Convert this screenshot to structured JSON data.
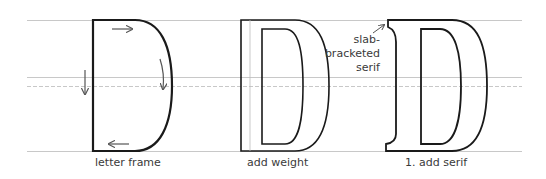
{
  "diagram": {
    "guidelines": [
      "cap-line",
      "mid-line",
      "dashed-mid-line",
      "baseline"
    ],
    "stages": [
      {
        "label": "letter frame"
      },
      {
        "label": "add weight"
      },
      {
        "label": "1. add serif"
      }
    ],
    "annotation": {
      "line1": "slab-",
      "line2": "bracketed",
      "line3": "serif"
    },
    "colors": {
      "stroke": "#1a1a1a",
      "guide": "#c8c8c8",
      "arrow": "#555555",
      "text": "#3a3a3a"
    }
  }
}
